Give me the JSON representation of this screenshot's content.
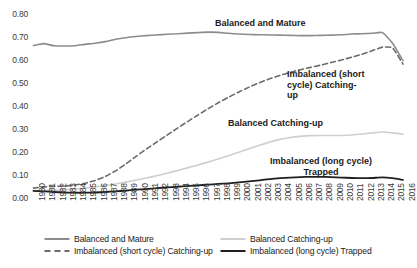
{
  "chart_data": {
    "type": "line",
    "title": "",
    "xlabel": "",
    "ylabel": "",
    "ylim": [
      0.0,
      0.8
    ],
    "ytick_step": 0.1,
    "grid": false,
    "legend_position": "bottom",
    "yticks": [
      "0.00",
      "0.10",
      "0.20",
      "0.30",
      "0.40",
      "0.50",
      "0.60",
      "0.70",
      "0.80"
    ],
    "x": [
      1980,
      1981,
      1982,
      1983,
      1984,
      1985,
      1986,
      1987,
      1988,
      1989,
      1990,
      1991,
      1992,
      1993,
      1994,
      1995,
      1996,
      1997,
      1998,
      1999,
      2000,
      2001,
      2002,
      2003,
      2004,
      2005,
      2006,
      2007,
      2008,
      2009,
      2010,
      2011,
      2012,
      2013,
      2014,
      2015,
      2016
    ],
    "xticks": [
      "1980",
      "1981",
      "1982",
      "1983",
      "1984",
      "1985",
      "1986",
      "1987",
      "1988",
      "1989",
      "1990",
      "1991",
      "1992",
      "1993",
      "1994",
      "1995",
      "1996",
      "1997",
      "1998",
      "1999",
      "2000",
      "2001",
      "2002",
      "2003",
      "2004",
      "2005",
      "2006",
      "2007",
      "2008",
      "2009",
      "2010",
      "2011",
      "2012",
      "2013",
      "2014",
      "2015",
      "2016"
    ],
    "series": [
      {
        "name": "Balanced and Mature",
        "style": "solid",
        "color": "#8c8c8c",
        "width": 1.6,
        "values": [
          0.663,
          0.671,
          0.662,
          0.661,
          0.662,
          0.668,
          0.673,
          0.68,
          0.69,
          0.697,
          0.702,
          0.706,
          0.709,
          0.712,
          0.714,
          0.717,
          0.719,
          0.721,
          0.72,
          0.716,
          0.713,
          0.711,
          0.71,
          0.709,
          0.708,
          0.707,
          0.706,
          0.706,
          0.707,
          0.708,
          0.71,
          0.713,
          0.714,
          0.716,
          0.719,
          0.672,
          0.597
        ]
      },
      {
        "name": "Imbalanced (short cycle) Catching-up",
        "style": "dashed",
        "color": "#6b6b6b",
        "width": 1.6,
        "values": [
          0.043,
          0.048,
          0.05,
          0.052,
          0.056,
          0.064,
          0.076,
          0.094,
          0.118,
          0.148,
          0.181,
          0.213,
          0.243,
          0.273,
          0.303,
          0.332,
          0.36,
          0.388,
          0.414,
          0.438,
          0.461,
          0.482,
          0.501,
          0.518,
          0.533,
          0.546,
          0.558,
          0.568,
          0.578,
          0.589,
          0.6,
          0.612,
          0.625,
          0.64,
          0.656,
          0.652,
          0.582
        ]
      },
      {
        "name": "Balanced Catching-up",
        "style": "solid",
        "color": "#cfcfcf",
        "width": 1.6,
        "values": [
          0.03,
          0.032,
          0.034,
          0.036,
          0.039,
          0.043,
          0.048,
          0.054,
          0.061,
          0.069,
          0.078,
          0.087,
          0.097,
          0.108,
          0.119,
          0.131,
          0.143,
          0.156,
          0.17,
          0.184,
          0.199,
          0.214,
          0.229,
          0.243,
          0.255,
          0.263,
          0.268,
          0.271,
          0.272,
          0.272,
          0.272,
          0.274,
          0.278,
          0.283,
          0.287,
          0.283,
          0.277
        ]
      },
      {
        "name": "Imbalanced (long cycle) Trapped",
        "style": "solid",
        "color": "#1f1f1f",
        "width": 1.8,
        "values": [
          0.031,
          0.029,
          0.026,
          0.024,
          0.023,
          0.023,
          0.024,
          0.026,
          0.029,
          0.032,
          0.036,
          0.039,
          0.043,
          0.046,
          0.049,
          0.052,
          0.055,
          0.058,
          0.061,
          0.064,
          0.068,
          0.072,
          0.077,
          0.082,
          0.086,
          0.089,
          0.091,
          0.092,
          0.092,
          0.091,
          0.089,
          0.087,
          0.086,
          0.087,
          0.09,
          0.086,
          0.079
        ]
      }
    ],
    "annotations": [
      {
        "text": "Balanced and Mature",
        "series": "Balanced and Mature"
      },
      {
        "text": "Imbalanced (short cycle) Catching-up",
        "series": "Imbalanced (short cycle) Catching-up"
      },
      {
        "text": "Balanced Catching-up",
        "series": "Balanced Catching-up"
      },
      {
        "text": "Imbalanced (long cycle) Trapped",
        "series": "Imbalanced (long cycle) Trapped"
      }
    ]
  },
  "annotation_labels": {
    "balanced_mature": "Balanced and Mature",
    "imbalanced_short_line1": "Imbalanced (short",
    "imbalanced_short_line2": "cycle) Catching-up",
    "balanced_catching": "Balanced Catching-up",
    "imbalanced_long_line1": "Imbalanced (long cycle)",
    "imbalanced_long_line2": "Trapped"
  },
  "legend": {
    "items": [
      {
        "label": "Balanced and Mature",
        "color": "#8c8c8c",
        "style": "solid"
      },
      {
        "label": "Balanced Catching-up",
        "color": "#cfcfcf",
        "style": "solid"
      },
      {
        "label": "Imbalanced (short cycle) Catching-up",
        "color": "#6b6b6b",
        "style": "dashed"
      },
      {
        "label": "Imbalanced (long cycle) Trapped",
        "color": "#1f1f1f",
        "style": "solid"
      }
    ]
  }
}
